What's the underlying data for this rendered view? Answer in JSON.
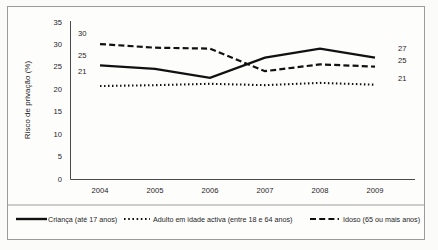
{
  "chart_data": {
    "type": "line",
    "title": "",
    "xlabel": "",
    "ylabel": "Risco de privação (%)",
    "categories": [
      "2004",
      "2005",
      "2006",
      "2007",
      "2008",
      "2009"
    ],
    "x": [
      2004,
      2005,
      2006,
      2007,
      2008,
      2009
    ],
    "ylim": [
      0,
      35
    ],
    "yticks": [
      "0",
      "5",
      "10",
      "15",
      "20",
      "25",
      "30",
      "35"
    ],
    "ytick_values": [
      0,
      5,
      10,
      15,
      20,
      25,
      30,
      35
    ],
    "grid": false,
    "legend_position": "bottom",
    "series": [
      {
        "name": "Criança (até 17 anos)",
        "style": "solid",
        "color": "#111111",
        "values": [
          25.3,
          24.5,
          22.5,
          27.0,
          29.0,
          27.0
        ],
        "start_label": "25",
        "end_label": "27"
      },
      {
        "name": "Adulto em idade activa (entre 18 e 64 anos)",
        "style": "dotted",
        "color": "#111111",
        "values": [
          20.7,
          20.9,
          21.2,
          20.9,
          21.4,
          21.0
        ],
        "start_label": "21",
        "end_label": "21"
      },
      {
        "name": "Idoso (65 ou mais anos)",
        "style": "dashed",
        "color": "#111111",
        "values": [
          30.0,
          29.2,
          29.0,
          24.0,
          25.5,
          25.0
        ],
        "start_label": "30",
        "end_label": "25"
      }
    ],
    "annotations": {
      "left_labels": [
        "30",
        "25",
        "21"
      ],
      "right_labels": [
        "27",
        "25",
        "21"
      ]
    }
  },
  "legend": {
    "items": [
      {
        "label": "Criança (até 17 anos)",
        "style": "solid"
      },
      {
        "label": "Adulto em idade activa (entre 18 e 64 anos)",
        "style": "dotted"
      },
      {
        "label": "Idoso (65 ou mais anos)",
        "style": "dashed"
      }
    ]
  },
  "axes": {
    "y_title": "Risco de privação (%)",
    "y_ticks": [
      "35",
      "30",
      "25",
      "20",
      "15",
      "10",
      "5",
      "0"
    ],
    "x_ticks": [
      "2004",
      "2005",
      "2006",
      "2007",
      "2008",
      "2009"
    ]
  }
}
